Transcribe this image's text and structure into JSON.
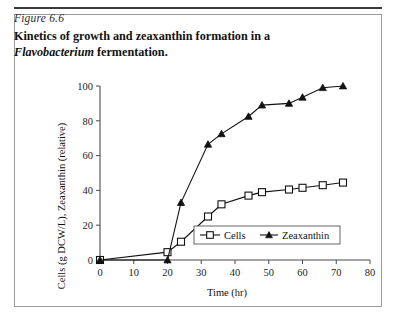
{
  "figure": {
    "number_label": "Figure 6.6",
    "title_line1": "Kinetics of growth and zeaxanthin formation in a",
    "title_genus": "Flavobacterium",
    "title_line2_tail": " fermentation."
  },
  "chart_data": {
    "type": "line",
    "title": "",
    "xlabel": "Time (hr)",
    "ylabel": "Cells (g DCW/L), Zeaxanthin (relative)",
    "xlim": [
      0,
      80
    ],
    "ylim": [
      0,
      100
    ],
    "xticks": [
      0,
      10,
      20,
      30,
      40,
      50,
      60,
      70,
      80
    ],
    "xticklabels": [
      "0",
      "10",
      "20",
      "30",
      "40",
      "50",
      "60",
      "70",
      "80"
    ],
    "yticks": [
      0,
      20,
      40,
      60,
      80,
      100
    ],
    "yticklabels": [
      "0",
      "20",
      "40",
      "60",
      "80",
      "100"
    ],
    "grid": false,
    "legend_position": "lower-center-right",
    "series": [
      {
        "name": "Cells",
        "marker": "open-square",
        "x": [
          0,
          20,
          24,
          32,
          36,
          44,
          48,
          56,
          60,
          66,
          72
        ],
        "y": [
          0,
          4.5,
          10.5,
          25,
          32,
          37,
          39,
          40.5,
          41.5,
          43,
          44.5
        ]
      },
      {
        "name": "Zeaxanthin",
        "marker": "filled-triangle",
        "x": [
          0,
          20,
          24,
          32,
          36,
          44,
          48,
          56,
          60,
          66,
          72
        ],
        "y": [
          0,
          0,
          33,
          66.5,
          72.5,
          82.5,
          89,
          90,
          93.5,
          99,
          100
        ]
      }
    ]
  },
  "colors": {
    "line": "#111111",
    "axis": "#4a4a4a",
    "frame": "#9a9a9a",
    "rule": "#3a3a3a"
  }
}
